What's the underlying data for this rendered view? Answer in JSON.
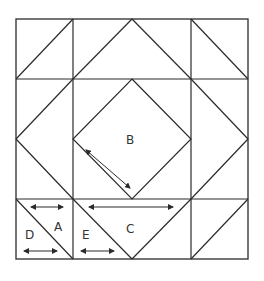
{
  "diagram": {
    "type": "quilt-block-pattern",
    "colors": {
      "line": "#2b2b2b",
      "background": "#ffffff",
      "label": "#333333"
    },
    "labels": {
      "A": "A",
      "B": "B",
      "C": "C",
      "D": "D",
      "E": "E"
    },
    "grid": {
      "columns": 4,
      "rows": 4
    }
  }
}
